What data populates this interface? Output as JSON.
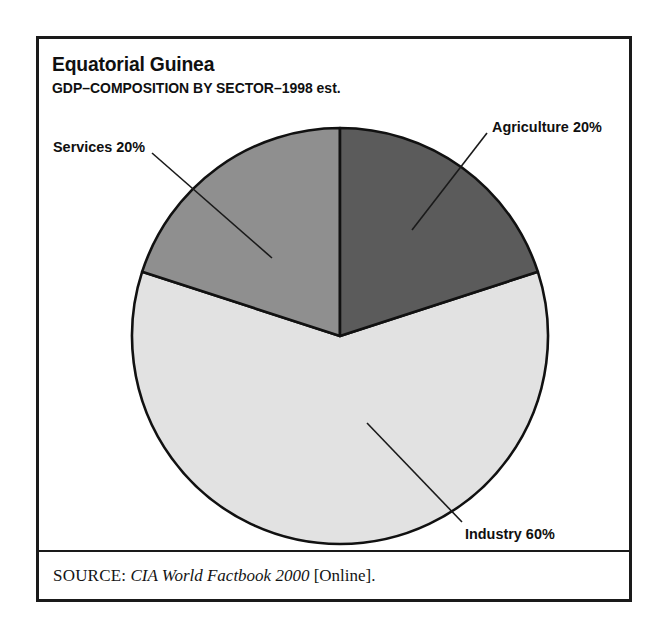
{
  "figure": {
    "title": "Equatorial Guinea",
    "subtitle": "GDP–COMPOSITION BY SECTOR–1998 est.",
    "source": {
      "label": "SOURCE:",
      "title": "CIA World Factbook 2000",
      "suffix": "[Online]."
    },
    "frame_color": "#1a1a1a",
    "background": "#ffffff"
  },
  "chart_data": {
    "type": "pie",
    "title": "Equatorial Guinea",
    "subtitle": "GDP–COMPOSITION BY SECTOR–1998 est.",
    "xlabel": "",
    "ylabel": "",
    "legend_position": "none",
    "grid": false,
    "start_angle_deg": 0,
    "direction": "clockwise",
    "categories": [
      "Agriculture",
      "Industry",
      "Services"
    ],
    "values": [
      20,
      60,
      20
    ],
    "unit": "percent",
    "labels": [
      "Agriculture 20%",
      "Industry 60%",
      "Services 20%"
    ],
    "colors": [
      "#5b5b5b",
      "#e2e2e2",
      "#8f8f8f"
    ],
    "slice_outline_color": "#111111",
    "slices": [
      {
        "name": "Agriculture",
        "value": 20,
        "label": "Agriculture 20%",
        "color": "#5b5b5b",
        "start_angle_deg": 0,
        "end_angle_deg": 72
      },
      {
        "name": "Industry",
        "value": 60,
        "label": "Industry 60%",
        "color": "#e2e2e2",
        "start_angle_deg": 72,
        "end_angle_deg": 288
      },
      {
        "name": "Services",
        "value": 20,
        "label": "Services 20%",
        "color": "#8f8f8f",
        "start_angle_deg": 288,
        "end_angle_deg": 360
      }
    ]
  }
}
